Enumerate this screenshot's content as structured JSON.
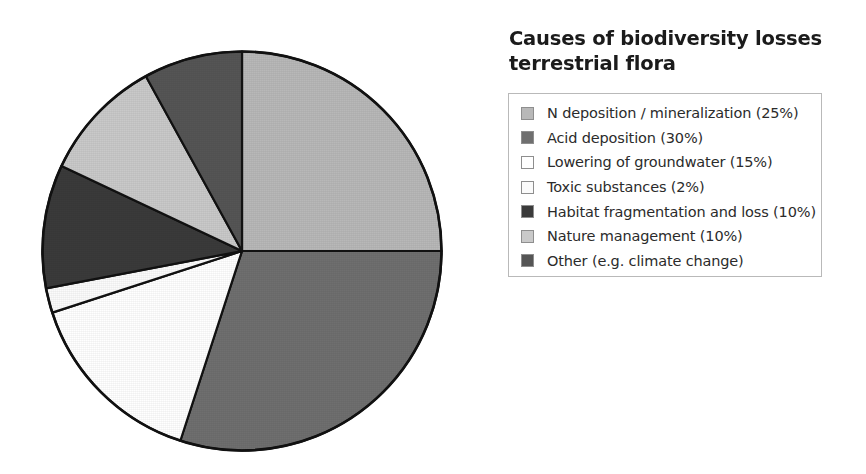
{
  "title": {
    "line1": "Causes of biodiversity losses",
    "line2": "terrestrial flora"
  },
  "legend": {
    "border_color": "#b9b9b9",
    "items": [
      {
        "label": "N deposition / mineralization (25%)",
        "swatch_name": "legend-swatch-n-deposition",
        "color": "#b8b8b8"
      },
      {
        "label": "Acid deposition (30%)",
        "swatch_name": "legend-swatch-acid-deposition",
        "color": "#6f6f6f"
      },
      {
        "label": "Lowering of groundwater (15%)",
        "swatch_name": "legend-swatch-lowering-groundwater",
        "color": "#ffffff"
      },
      {
        "label": "Toxic substances (2%)",
        "swatch_name": "legend-swatch-toxic-substances",
        "color": "#fbfbfb"
      },
      {
        "label": "Habitat fragmentation and loss (10%)",
        "swatch_name": "legend-swatch-habitat-fragmentation",
        "color": "#3a3a3a"
      },
      {
        "label": "Nature management (10%)",
        "swatch_name": "legend-swatch-nature-management",
        "color": "#c9c9c9"
      },
      {
        "label": "Other (e.g. climate change)",
        "swatch_name": "legend-swatch-other",
        "color": "#555555"
      }
    ]
  },
  "chart_data": {
    "type": "pie",
    "title": "Causes of biodiversity losses terrestrial flora",
    "categories": [
      "N deposition / mineralization",
      "Acid deposition",
      "Lowering of groundwater",
      "Toxic substances",
      "Habitat fragmentation and loss",
      "Nature management",
      "Other (e.g. climate change)"
    ],
    "values": [
      25,
      30,
      15,
      2,
      10,
      10,
      8
    ],
    "value_unit": "%",
    "labels": [
      "N deposition / mineralization (25%)",
      "Acid deposition (30%)",
      "Lowering of groundwater (15%)",
      "Toxic substances (2%)",
      "Habitat fragmentation and loss (10%)",
      "Nature management (10%)",
      "Other (e.g. climate change)"
    ],
    "colors": [
      "#b8b8b8",
      "#6f6f6f",
      "#ffffff",
      "#fbfbfb",
      "#3a3a3a",
      "#c9c9c9",
      "#555555"
    ],
    "start_angle_deg": 0,
    "direction": "clockwise",
    "legend_position": "right",
    "grid": false,
    "outline_color": "#111111",
    "xlabel": "",
    "ylabel": ""
  }
}
